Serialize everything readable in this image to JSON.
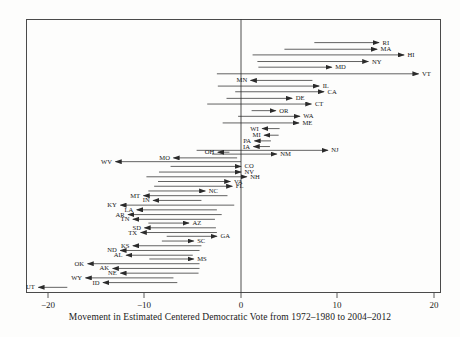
{
  "figure": {
    "caption": "Movement in Estimated Centered Democratic Vote from 1972–1980 to 2004–2012",
    "frame": {
      "left": 26,
      "top": 19,
      "width": 415,
      "height": 274
    }
  },
  "axis": {
    "ticks": [
      {
        "value": -20,
        "label": "−20",
        "x": 48
      },
      {
        "value": -10,
        "label": "−10",
        "x": 144
      },
      {
        "value": 0,
        "label": "0",
        "x": 241
      },
      {
        "value": 10,
        "label": "10",
        "x": 337
      },
      {
        "value": 20,
        "label": "20",
        "x": 434
      }
    ],
    "zero_line_x": 241,
    "px_per_unit": 9.65,
    "xlim": [
      -22.3,
      22.7
    ]
  },
  "chart_data": {
    "type": "arrow",
    "title": "",
    "subtitle": "",
    "xlabel": "Movement in Estimated Centered Democratic Vote from 1972–1980 to 2004–2012",
    "ylabel": "",
    "xlim": [
      -22.3,
      22.7
    ],
    "ylim": [
      0,
      50
    ],
    "xticks": [
      -20,
      -10,
      0,
      10,
      20
    ],
    "grid": false,
    "legend": null,
    "note": "Each row is a US state. The tail of the arrow is the 1972–1980 centered Democratic vote position; the head of the arrow is the 2004–2012 position. Arrows pointing right indicate a Democratic gain; arrows pointing left indicate a Democratic loss. States are ordered top (largest gain) to bottom (largest loss).",
    "series": [
      {
        "state": "RI",
        "row": 1,
        "start": 7.6,
        "end": 14.3,
        "direction": "right",
        "y": 25
      },
      {
        "state": "MA",
        "row": 2,
        "start": 4.5,
        "end": 14.1,
        "direction": "right",
        "y": 32
      },
      {
        "state": "HI",
        "row": 3,
        "start": 1.2,
        "end": 16.9,
        "direction": "right",
        "y": 38
      },
      {
        "state": "NY",
        "row": 4,
        "start": 1.7,
        "end": 13.2,
        "direction": "right",
        "y": 45
      },
      {
        "state": "MD",
        "row": 5,
        "start": 1.8,
        "end": 9.4,
        "direction": "right",
        "y": 51
      },
      {
        "state": "VT",
        "row": 6,
        "start": -2.5,
        "end": 18.4,
        "direction": "right",
        "y": 58
      },
      {
        "state": "MN",
        "row": 7,
        "start": 7.4,
        "end": 1.0,
        "direction": "left",
        "y": 65
      },
      {
        "state": "IL",
        "row": 8,
        "start": -2.4,
        "end": 8.1,
        "direction": "right",
        "y": 71
      },
      {
        "state": "CA",
        "row": 9,
        "start": -0.6,
        "end": 8.6,
        "direction": "right",
        "y": 77
      },
      {
        "state": "DE",
        "row": 10,
        "start": -1.5,
        "end": 5.3,
        "direction": "right",
        "y": 84
      },
      {
        "state": "CT",
        "row": 11,
        "start": -3.5,
        "end": 7.3,
        "direction": "right",
        "y": 90
      },
      {
        "state": "OR",
        "row": 12,
        "start": 1.1,
        "end": 3.6,
        "direction": "right",
        "y": 97
      },
      {
        "state": "WA",
        "row": 13,
        "start": -0.3,
        "end": 6.1,
        "direction": "right",
        "y": 103
      },
      {
        "state": "ME",
        "row": 14,
        "start": -1.9,
        "end": 6.0,
        "direction": "right",
        "y": 110
      },
      {
        "state": "WI",
        "row": 15,
        "start": 4.0,
        "end": 2.2,
        "direction": "left",
        "y": 116
      },
      {
        "state": "MI",
        "row": 16,
        "start": 3.9,
        "end": 2.4,
        "direction": "right",
        "y": 123
      },
      {
        "state": "PA",
        "row": 17,
        "start": 3.1,
        "end": 1.4,
        "direction": "left",
        "y": 129
      },
      {
        "state": "IA",
        "row": 18,
        "start": 3.0,
        "end": 1.3,
        "direction": "left",
        "y": 135
      },
      {
        "state": "NJ",
        "row": 19,
        "start": -4.6,
        "end": 9.0,
        "direction": "right",
        "y": 139
      },
      {
        "state": "NM",
        "row": 20,
        "start": -3.0,
        "end": 3.7,
        "direction": "right",
        "y": 143
      },
      {
        "state": "OH",
        "row": 21,
        "start": -1.2,
        "end": -2.4,
        "direction": "left",
        "y": 141
      },
      {
        "state": "MO",
        "row": 22,
        "start": -0.4,
        "end": -7.0,
        "direction": "left",
        "y": 147
      },
      {
        "state": "WV",
        "row": 23,
        "start": 0.0,
        "end": -13.0,
        "direction": "left",
        "y": 151
      },
      {
        "state": "CO",
        "row": 24,
        "start": -7.3,
        "end": 0.0,
        "direction": "right",
        "y": 156
      },
      {
        "state": "NV",
        "row": 25,
        "start": -8.5,
        "end": 0.0,
        "direction": "right",
        "y": 162
      },
      {
        "state": "NH",
        "row": 26,
        "start": -9.8,
        "end": 0.6,
        "direction": "right",
        "y": 167
      },
      {
        "state": "VA",
        "row": 27,
        "start": -8.6,
        "end": -1.1,
        "direction": "right",
        "y": 172
      },
      {
        "state": "FL",
        "row": 28,
        "start": -9.0,
        "end": -0.9,
        "direction": "right",
        "y": 177
      },
      {
        "state": "NC",
        "row": 29,
        "start": -9.6,
        "end": -3.7,
        "direction": "right",
        "y": 182
      },
      {
        "state": "MT",
        "row": 30,
        "start": -1.4,
        "end": -10.1,
        "direction": "left",
        "y": 187
      },
      {
        "state": "IN",
        "row": 31,
        "start": -4.1,
        "end": -9.1,
        "direction": "left",
        "y": 192
      },
      {
        "state": "KY",
        "row": 32,
        "start": -0.7,
        "end": -12.5,
        "direction": "left",
        "y": 197
      },
      {
        "state": "LA",
        "row": 33,
        "start": -2.5,
        "end": -10.8,
        "direction": "left",
        "y": 202
      },
      {
        "state": "AR",
        "row": 34,
        "start": -2.0,
        "end": -11.7,
        "direction": "left",
        "y": 207
      },
      {
        "state": "TN",
        "row": 35,
        "start": -2.7,
        "end": -11.2,
        "direction": "left",
        "y": 212
      },
      {
        "state": "AZ",
        "row": 36,
        "start": -9.6,
        "end": -5.4,
        "direction": "right",
        "y": 216
      },
      {
        "state": "SD",
        "row": 37,
        "start": -2.6,
        "end": -10.0,
        "direction": "left",
        "y": 221
      },
      {
        "state": "TX",
        "row": 38,
        "start": -2.5,
        "end": -10.4,
        "direction": "left",
        "y": 226
      },
      {
        "state": "GA",
        "row": 39,
        "start": -7.7,
        "end": -2.5,
        "direction": "right",
        "y": 230
      },
      {
        "state": "SC",
        "row": 40,
        "start": -8.2,
        "end": -4.9,
        "direction": "right",
        "y": 235
      },
      {
        "state": "KS",
        "row": 41,
        "start": -4.1,
        "end": -11.2,
        "direction": "left",
        "y": 240
      },
      {
        "state": "ND",
        "row": 42,
        "start": -4.3,
        "end": -12.5,
        "direction": "left",
        "y": 245
      },
      {
        "state": "AL",
        "row": 43,
        "start": -5.0,
        "end": -11.9,
        "direction": "left",
        "y": 250
      },
      {
        "state": "MS",
        "row": 44,
        "start": -9.5,
        "end": -4.9,
        "direction": "right",
        "y": 254
      },
      {
        "state": "OK",
        "row": 45,
        "start": -4.3,
        "end": -15.9,
        "direction": "left",
        "y": 259
      },
      {
        "state": "AK",
        "row": 46,
        "start": -4.3,
        "end": -13.3,
        "direction": "left",
        "y": 264
      },
      {
        "state": "NE",
        "row": 47,
        "start": -4.4,
        "end": -12.5,
        "direction": "left",
        "y": 269
      },
      {
        "state": "WY",
        "row": 48,
        "start": -7.0,
        "end": -16.1,
        "direction": "left",
        "y": 274
      },
      {
        "state": "ID",
        "row": 49,
        "start": -6.6,
        "end": -14.3,
        "direction": "left",
        "y": 279
      },
      {
        "state": "UT",
        "row": 50,
        "start": -18.0,
        "end": -21.0,
        "direction": "left",
        "y": 284
      }
    ]
  }
}
